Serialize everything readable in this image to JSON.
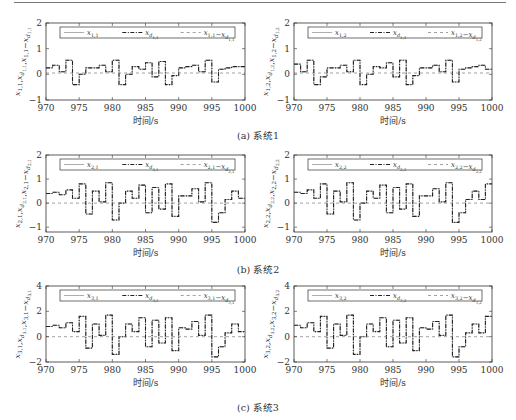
{
  "chart_data": [
    {
      "id": "a-left",
      "type": "line",
      "subplot": "(a) 系统1, left",
      "xlabel": "时间/s",
      "ylabel": "x_{1,1}, x_{d_{1,1}}, x_{1,1}-x_{d_{1,1}}",
      "xlim": [
        970,
        1000
      ],
      "ylim": [
        -1,
        2
      ],
      "xticks": [
        970,
        975,
        980,
        985,
        990,
        995,
        1000
      ],
      "yticks": [
        -1,
        0,
        1,
        2
      ],
      "legend": [
        "x_{1,1}",
        "x_{d_{1,1}}",
        "x_{1,1}-x_{d_{1,1}}"
      ],
      "legend_position": "top",
      "x": [
        970,
        971,
        972,
        973,
        974,
        975,
        976,
        977,
        978,
        979,
        980,
        981,
        982,
        983,
        984,
        985,
        986,
        987,
        988,
        989,
        990,
        991,
        992,
        993,
        994,
        995,
        996,
        997,
        998,
        999,
        1000
      ],
      "series": [
        {
          "name": "x_{1,1}",
          "values": [
            0.25,
            0.35,
            0.1,
            0.55,
            -0.4,
            0.0,
            0.25,
            0.25,
            0.35,
            0.1,
            0.55,
            -0.4,
            0.0,
            0.3,
            0.2,
            0.45,
            -0.1,
            0.5,
            -0.4,
            -0.05,
            0.25,
            0.3,
            0.35,
            0.1,
            0.55,
            -0.3,
            0.2,
            0.25,
            0.3,
            0.3,
            0.35
          ]
        },
        {
          "name": "x_{d_{1,1}}",
          "values": [
            0.25,
            0.35,
            0.1,
            0.55,
            -0.4,
            0.0,
            0.25,
            0.25,
            0.35,
            0.1,
            0.55,
            -0.4,
            0.0,
            0.3,
            0.2,
            0.45,
            -0.1,
            0.5,
            -0.4,
            -0.05,
            0.25,
            0.3,
            0.35,
            0.1,
            0.55,
            -0.3,
            0.2,
            0.25,
            0.3,
            0.3,
            0.35
          ]
        },
        {
          "name": "x_{1,1}-x_{d_{1,1}}",
          "values": [
            0.05,
            0.05,
            0.05,
            0.05,
            0.05,
            0.05,
            0.05,
            0.05,
            0.05,
            0.05,
            0.05,
            0.05,
            0.05,
            0.05,
            0.05,
            0.05,
            0.05,
            0.05,
            0.05,
            0.05,
            0.05,
            0.05,
            0.05,
            0.05,
            0.05,
            0.05,
            0.05,
            0.05,
            0.05,
            0.05,
            0.05
          ]
        }
      ]
    },
    {
      "id": "a-right",
      "type": "line",
      "subplot": "(a) 系统1, right",
      "xlabel": "时间/s",
      "ylabel": "x_{1,2}, x_{d_{1,2}}, x_{1,2}-x_{d_{1,2}}",
      "xlim": [
        970,
        1000
      ],
      "ylim": [
        -1,
        2
      ],
      "xticks": [
        970,
        975,
        980,
        985,
        990,
        995,
        1000
      ],
      "yticks": [
        -1,
        0,
        1,
        2
      ],
      "legend": [
        "x_{1,2}",
        "x_{d_{1,2}}",
        "x_{1,2}-x_{d_{1,2}}"
      ],
      "legend_position": "top",
      "x": [
        970,
        971,
        972,
        973,
        974,
        975,
        976,
        977,
        978,
        979,
        980,
        981,
        982,
        983,
        984,
        985,
        986,
        987,
        988,
        989,
        990,
        991,
        992,
        993,
        994,
        995,
        996,
        997,
        998,
        999,
        1000
      ],
      "series": [
        {
          "name": "x_{1,2}",
          "values": [
            0.4,
            0.1,
            0.55,
            -0.4,
            -0.1,
            0.25,
            0.25,
            0.35,
            0.1,
            0.55,
            -0.4,
            0.0,
            0.3,
            0.25,
            0.45,
            -0.1,
            0.55,
            -0.4,
            -0.05,
            0.25,
            0.25,
            0.35,
            0.1,
            0.55,
            -0.3,
            0.2,
            0.25,
            0.3,
            0.35,
            0.2,
            0.2
          ]
        },
        {
          "name": "x_{d_{1,2}}",
          "values": [
            0.4,
            0.1,
            0.55,
            -0.4,
            -0.1,
            0.25,
            0.25,
            0.35,
            0.1,
            0.55,
            -0.4,
            0.0,
            0.3,
            0.25,
            0.45,
            -0.1,
            0.55,
            -0.4,
            -0.05,
            0.25,
            0.25,
            0.35,
            0.1,
            0.55,
            -0.3,
            0.2,
            0.25,
            0.3,
            0.35,
            0.2,
            0.2
          ]
        },
        {
          "name": "x_{1,2}-x_{d_{1,2}}",
          "values": [
            0.05,
            0.05,
            0.05,
            0.05,
            0.05,
            0.05,
            0.05,
            0.05,
            0.05,
            0.05,
            0.05,
            0.05,
            0.05,
            0.05,
            0.05,
            0.05,
            0.05,
            0.05,
            0.05,
            0.05,
            0.05,
            0.05,
            0.05,
            0.05,
            0.05,
            0.05,
            0.05,
            0.05,
            0.05,
            0.05,
            0.05
          ]
        }
      ]
    },
    {
      "id": "b-left",
      "type": "line",
      "subplot": "(b) 系统2, left",
      "xlabel": "时间/s",
      "ylabel": "x_{2,1}, x_{d_{2,1}}, x_{2,1}-x_{d_{2,1}}",
      "xlim": [
        970,
        1000
      ],
      "ylim": [
        -1.2,
        2
      ],
      "xticks": [
        970,
        975,
        980,
        985,
        990,
        995,
        1000
      ],
      "yticks": [
        -1,
        0,
        1,
        2
      ],
      "legend": [
        "x_{2,1}",
        "x_{d_{2,1}}",
        "x_{2,1}-x_{d_{2,1}}"
      ],
      "legend_position": "top",
      "x": [
        970,
        971,
        972,
        973,
        974,
        975,
        976,
        977,
        978,
        979,
        980,
        981,
        982,
        983,
        984,
        985,
        986,
        987,
        988,
        989,
        990,
        991,
        992,
        993,
        994,
        995,
        996,
        997,
        998,
        999,
        1000
      ],
      "series": [
        {
          "name": "x_{2,1}",
          "values": [
            0.4,
            0.45,
            0.35,
            0.55,
            0.2,
            0.8,
            -0.45,
            0.5,
            0.05,
            0.85,
            -0.7,
            0.0,
            0.5,
            0.2,
            0.75,
            -0.4,
            0.65,
            -0.25,
            0.8,
            -0.55,
            0.3,
            0.3,
            0.6,
            0.05,
            0.85,
            -0.8,
            -0.4,
            0.15,
            0.5,
            0.2,
            0.2
          ]
        },
        {
          "name": "x_{d_{2,1}}",
          "values": [
            0.4,
            0.45,
            0.35,
            0.55,
            0.2,
            0.8,
            -0.45,
            0.5,
            0.05,
            0.85,
            -0.7,
            0.0,
            0.5,
            0.2,
            0.75,
            -0.4,
            0.65,
            -0.25,
            0.8,
            -0.55,
            0.3,
            0.3,
            0.6,
            0.05,
            0.85,
            -0.8,
            -0.4,
            0.15,
            0.5,
            0.2,
            0.2
          ]
        },
        {
          "name": "x_{2,1}-x_{d_{2,1}}",
          "values": [
            0,
            0,
            0,
            0,
            0,
            0,
            0,
            0,
            0,
            0,
            0,
            0,
            0,
            0,
            0,
            0,
            0,
            0,
            0,
            0,
            0,
            0,
            0,
            0,
            0,
            0,
            0,
            0,
            0,
            0,
            0
          ]
        }
      ]
    },
    {
      "id": "b-right",
      "type": "line",
      "subplot": "(b) 系统2, right",
      "xlabel": "时间/s",
      "ylabel": "x_{2,2}, x_{d_{2,2}}, x_{2,2}-x_{d_{2,2}}",
      "xlim": [
        970,
        1000
      ],
      "ylim": [
        -1.2,
        2
      ],
      "xticks": [
        970,
        975,
        980,
        985,
        990,
        995,
        1000
      ],
      "yticks": [
        -1,
        0,
        1,
        2
      ],
      "legend": [
        "x_{2,2}",
        "x_{d_{2,2}}",
        "x_{2,2}-x_{d_{2,2}}"
      ],
      "legend_position": "top",
      "x": [
        970,
        971,
        972,
        973,
        974,
        975,
        976,
        977,
        978,
        979,
        980,
        981,
        982,
        983,
        984,
        985,
        986,
        987,
        988,
        989,
        990,
        991,
        992,
        993,
        994,
        995,
        996,
        997,
        998,
        999,
        1000
      ],
      "series": [
        {
          "name": "x_{2,2}",
          "values": [
            0.45,
            0.4,
            0.55,
            0.2,
            0.8,
            -0.45,
            0.5,
            0.05,
            0.85,
            -0.7,
            0.0,
            0.5,
            0.2,
            0.75,
            -0.4,
            0.65,
            -0.25,
            0.8,
            -0.55,
            0.3,
            0.3,
            0.6,
            0.05,
            0.85,
            -0.8,
            -0.4,
            0.15,
            0.5,
            0.15,
            0.8,
            0.8
          ]
        },
        {
          "name": "x_{d_{2,2}}",
          "values": [
            0.45,
            0.4,
            0.55,
            0.2,
            0.8,
            -0.45,
            0.5,
            0.05,
            0.85,
            -0.7,
            0.0,
            0.5,
            0.2,
            0.75,
            -0.4,
            0.65,
            -0.25,
            0.8,
            -0.55,
            0.3,
            0.3,
            0.6,
            0.05,
            0.85,
            -0.8,
            -0.4,
            0.15,
            0.5,
            0.15,
            0.8,
            0.8
          ]
        },
        {
          "name": "x_{2,2}-x_{d_{2,2}}",
          "values": [
            0,
            0,
            0,
            0,
            0,
            0,
            0,
            0,
            0,
            0,
            0,
            0,
            0,
            0,
            0,
            0,
            0,
            0,
            0,
            0,
            0,
            0,
            0,
            0,
            0,
            0,
            0,
            0,
            0,
            0,
            0
          ]
        }
      ]
    },
    {
      "id": "c-left",
      "type": "line",
      "subplot": "(c) 系统3, left",
      "xlabel": "时间/s",
      "ylabel": "x_{3,1}, x_{d_{3,1}}, x_{3,1}-x_{d_{3,1}}",
      "xlim": [
        970,
        1000
      ],
      "ylim": [
        -2,
        4
      ],
      "xticks": [
        970,
        975,
        980,
        985,
        990,
        995,
        1000
      ],
      "yticks": [
        -2,
        0,
        2,
        4
      ],
      "legend": [
        "x_{3,1}",
        "x_{d_{3,1}}",
        "x_{3,1}-x_{d_{3,1}}"
      ],
      "legend_position": "top",
      "x": [
        970,
        971,
        972,
        973,
        974,
        975,
        976,
        977,
        978,
        979,
        980,
        981,
        982,
        983,
        984,
        985,
        986,
        987,
        988,
        989,
        990,
        991,
        992,
        993,
        994,
        995,
        996,
        997,
        998,
        999,
        1000
      ],
      "series": [
        {
          "name": "x_{3,1}",
          "values": [
            0.8,
            0.9,
            0.7,
            1.1,
            0.4,
            1.6,
            -0.9,
            1.0,
            0.1,
            1.7,
            -1.4,
            0.0,
            1.0,
            0.4,
            1.5,
            -0.8,
            1.3,
            -0.5,
            1.5,
            -1.1,
            0.7,
            0.6,
            1.2,
            0.1,
            1.7,
            -1.6,
            -0.8,
            0.3,
            1.0,
            0.4,
            0.4
          ]
        },
        {
          "name": "x_{d_{3,1}}",
          "values": [
            0.8,
            0.9,
            0.7,
            1.1,
            0.4,
            1.6,
            -0.9,
            1.0,
            0.1,
            1.7,
            -1.4,
            0.0,
            1.0,
            0.4,
            1.5,
            -0.8,
            1.3,
            -0.5,
            1.5,
            -1.1,
            0.7,
            0.6,
            1.2,
            0.1,
            1.7,
            -1.6,
            -0.8,
            0.3,
            1.0,
            0.4,
            0.4
          ]
        },
        {
          "name": "x_{3,1}-x_{d_{3,1}}",
          "values": [
            0,
            0,
            0,
            0,
            0,
            0,
            0,
            0,
            0,
            0,
            0,
            0,
            0,
            0,
            0,
            0,
            0,
            0,
            0,
            0,
            0,
            0,
            0,
            0,
            0,
            0,
            0,
            0,
            0,
            0,
            0
          ]
        }
      ]
    },
    {
      "id": "c-right",
      "type": "line",
      "subplot": "(c) 系统3, right",
      "xlabel": "时间/s",
      "ylabel": "x_{3,2}, x_{d_{3,2}}, x_{3,2}-x_{d_{3,2}}",
      "xlim": [
        970,
        1000
      ],
      "ylim": [
        -2,
        4
      ],
      "xticks": [
        970,
        975,
        980,
        985,
        990,
        995,
        1000
      ],
      "yticks": [
        -2,
        0,
        2,
        4
      ],
      "legend": [
        "x_{3,2}",
        "x_{d_{3,2}}",
        "x_{3,2}-x_{d_{3,2}}"
      ],
      "legend_position": "top",
      "x": [
        970,
        971,
        972,
        973,
        974,
        975,
        976,
        977,
        978,
        979,
        980,
        981,
        982,
        983,
        984,
        985,
        986,
        987,
        988,
        989,
        990,
        991,
        992,
        993,
        994,
        995,
        996,
        997,
        998,
        999,
        1000
      ],
      "series": [
        {
          "name": "x_{3,2}",
          "values": [
            0.9,
            0.7,
            1.1,
            0.4,
            1.6,
            -0.9,
            1.0,
            0.1,
            1.7,
            -1.4,
            0.0,
            1.0,
            0.4,
            1.5,
            -0.8,
            1.3,
            -0.5,
            1.5,
            -1.1,
            0.7,
            0.6,
            1.2,
            0.1,
            1.7,
            -1.6,
            -0.8,
            0.3,
            1.0,
            0.3,
            1.6,
            1.6
          ]
        },
        {
          "name": "x_{d_{3,2}}",
          "values": [
            0.9,
            0.7,
            1.1,
            0.4,
            1.6,
            -0.9,
            1.0,
            0.1,
            1.7,
            -1.4,
            0.0,
            1.0,
            0.4,
            1.5,
            -0.8,
            1.3,
            -0.5,
            1.5,
            -1.1,
            0.7,
            0.6,
            1.2,
            0.1,
            1.7,
            -1.6,
            -0.8,
            0.3,
            1.0,
            0.3,
            1.6,
            1.6
          ]
        },
        {
          "name": "x_{3,2}-x_{d_{3,2}}",
          "values": [
            0,
            0,
            0,
            0,
            0,
            0,
            0,
            0,
            0,
            0,
            0,
            0,
            0,
            0,
            0,
            0,
            0,
            0,
            0,
            0,
            0,
            0,
            0,
            0,
            0,
            0,
            0,
            0,
            0,
            0,
            0
          ]
        }
      ]
    }
  ],
  "captions": {
    "a": "(a) 系统1",
    "b": "(b) 系统2",
    "c": "(c) 系统3"
  },
  "axis": {
    "xlabel": "时间/s"
  },
  "colors": {
    "axis": "#333333",
    "line": "#222222",
    "error": "#777777"
  }
}
